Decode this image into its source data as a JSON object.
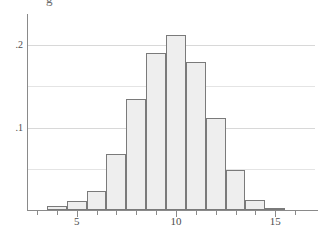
{
  "figure": {
    "name": "histogram-figure",
    "clipped_caption_fragment": "g",
    "background_color": "#ffffff",
    "bar_fill_color": "#eeeeee",
    "bar_edge_color": "#7a7a7a",
    "axis_color": "#8a8a8a",
    "gridline_color": "#d8d8d8"
  },
  "chart_data": {
    "type": "bar",
    "title": "",
    "subtitle": "",
    "xlabel": "",
    "ylabel": "",
    "grid": true,
    "legend": false,
    "legend_position": "none",
    "xlim": [
      2.5,
      17.0
    ],
    "ylim": [
      0,
      0.225
    ],
    "bin_width": 1,
    "x_tick_labels": [
      "5",
      "10",
      "15"
    ],
    "x_tick_values": [
      5,
      10,
      15
    ],
    "x_minor_ticks": [
      3,
      4,
      6,
      7,
      8,
      9,
      11,
      12,
      13,
      14,
      16
    ],
    "y_tick_labels": [
      ".1",
      ".2"
    ],
    "y_tick_values": [
      0.1,
      0.2
    ],
    "y_gridline_values": [
      0.05,
      0.1,
      0.15,
      0.2
    ],
    "categories": [
      "3.5-4.5",
      "4.5-5.5",
      "5.5-6.5",
      "6.5-7.5",
      "7.5-8.5",
      "8.5-9.5",
      "9.5-10.5",
      "10.5-11.5",
      "11.5-12.5",
      "12.5-13.5",
      "13.5-14.5",
      "14.5-15.5"
    ],
    "bin_centers": [
      4,
      5,
      6,
      7,
      8,
      9,
      10,
      11,
      12,
      13,
      14,
      15
    ],
    "bin_left_edges": [
      3.5,
      4.5,
      5.5,
      6.5,
      7.5,
      8.5,
      9.5,
      10.5,
      11.5,
      12.5,
      13.5,
      14.5
    ],
    "values": [
      0.005,
      0.011,
      0.023,
      0.068,
      0.135,
      0.19,
      0.212,
      0.18,
      0.112,
      0.048,
      0.012,
      0.003
    ],
    "series": [
      {
        "name": "density",
        "values": [
          0.005,
          0.011,
          0.023,
          0.068,
          0.135,
          0.19,
          0.212,
          0.18,
          0.112,
          0.048,
          0.012,
          0.003
        ]
      }
    ]
  }
}
